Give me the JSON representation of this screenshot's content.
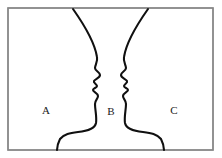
{
  "figure": {
    "name": "rubin-vase-face-ground-illusion",
    "background_color": "#ffffff",
    "frame": {
      "stroke_color": "#888888",
      "x": 8,
      "y": 8,
      "width": 205,
      "height": 142
    },
    "contour": {
      "stroke_color": "#101010",
      "stroke_width": 2.1,
      "description": "two mirrored human face profiles facing each other"
    },
    "labels": [
      {
        "id": "label-a",
        "text": "A",
        "x": 46,
        "y": 111
      },
      {
        "id": "label-b",
        "text": "B",
        "x": 111,
        "y": 112
      },
      {
        "id": "label-c",
        "text": "C",
        "x": 174,
        "y": 111
      }
    ],
    "left_profile_path": "M 73 9 C 85 26, 95 44, 97 57 C 98 62, 95 65, 95 68 C 95 71, 100 72, 100 75 C 100 78, 95 79, 94 81 C 93 83, 97 84, 97 86 C 97 88, 93 88, 93 90 C 93 92, 98 93, 98 96 C 98 99, 95 100, 95 104 C 95 110, 97 117, 96 123 C 95 128, 88 131, 78 132 C 70 133, 64 134, 60 139 C 58 143, 57 147, 57 150",
    "right_profile_path": "M 148 9 C 136 26, 126 44, 124 57 C 123 62, 126 65, 126 68 C 126 71, 121 72, 121 75 C 121 78, 126 79, 127 81 C 128 83, 124 84, 124 86 C 124 88, 128 88, 128 90 C 128 92, 123 93, 123 96 C 123 99, 126 100, 126 104 C 126 110, 124 117, 125 123 C 126 128, 133 131, 143 132 C 151 133, 157 134, 161 139 C 163 143, 164 147, 164 150"
  }
}
